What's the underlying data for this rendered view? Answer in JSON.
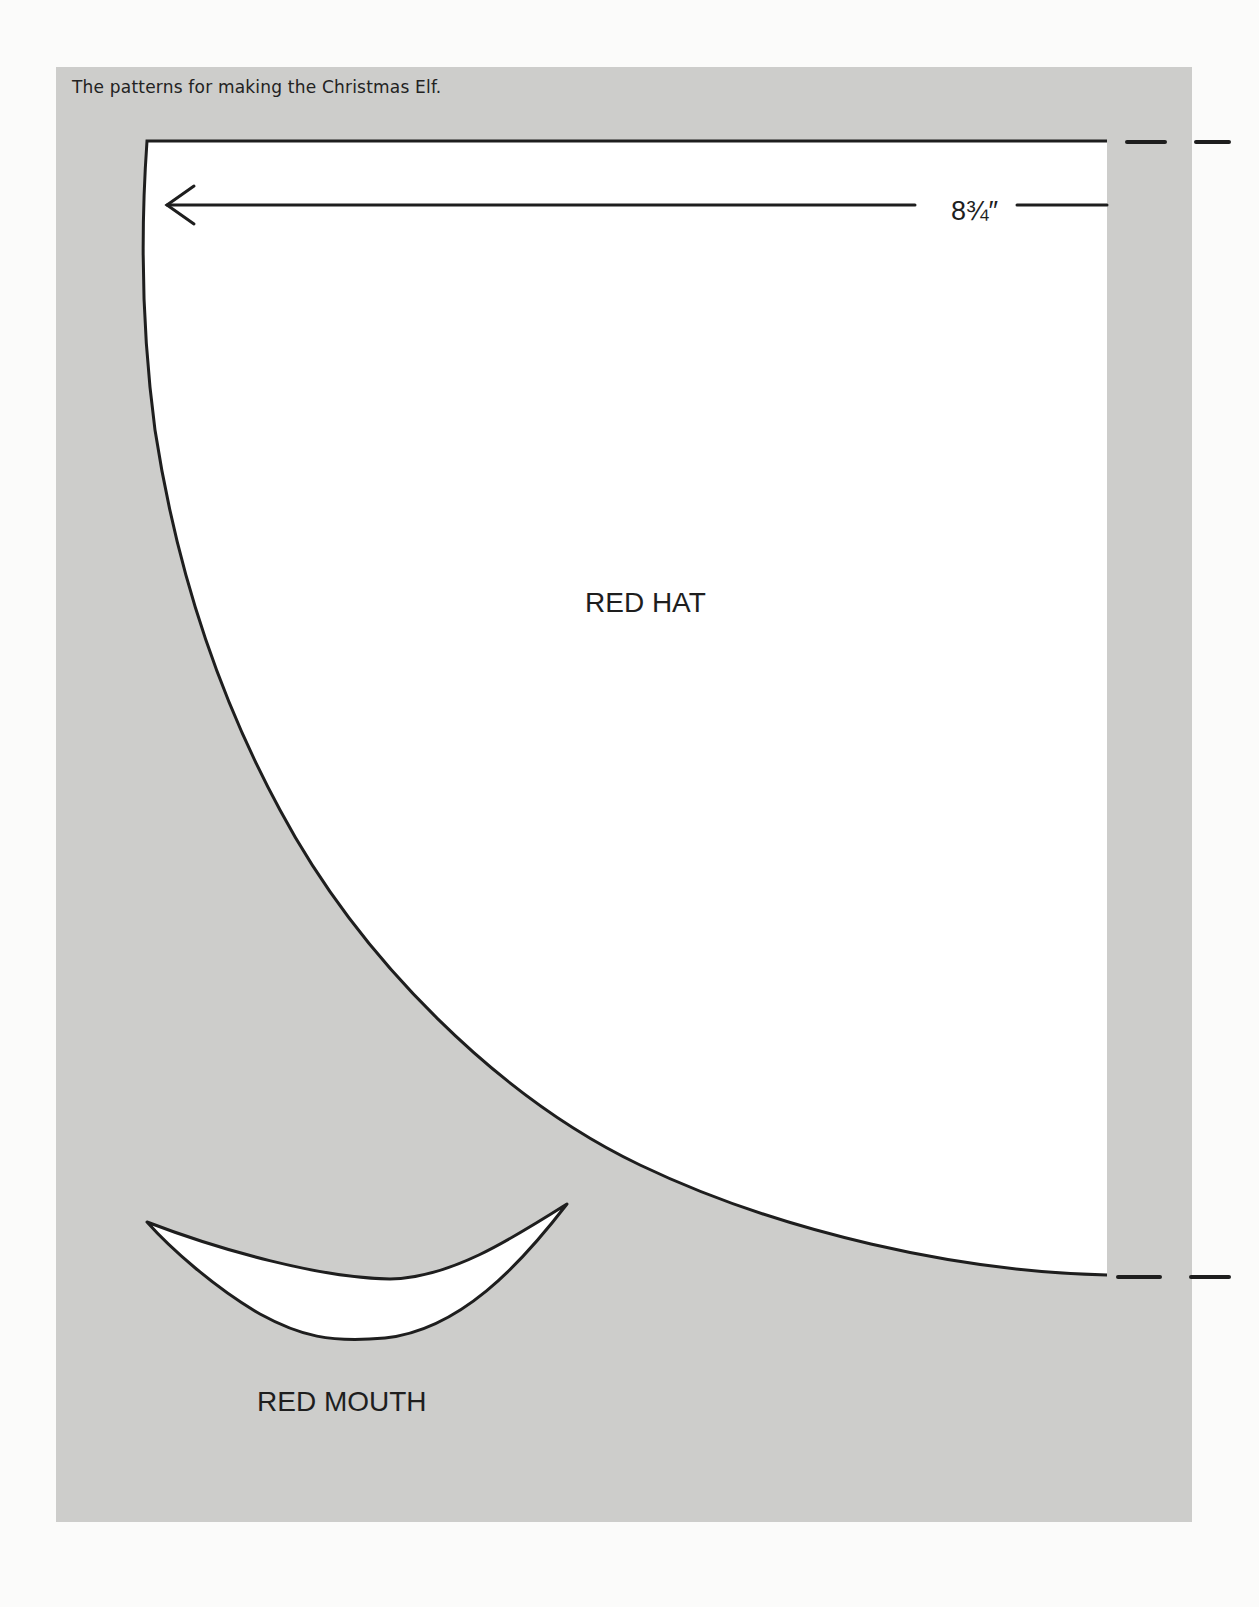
{
  "caption": "The patterns for making the Christmas Elf.",
  "patterns": [
    {
      "name": "hat",
      "label": "RED HAT",
      "dimension": "8¾″"
    },
    {
      "name": "mouth",
      "label": "RED MOUTH"
    }
  ],
  "colors": {
    "page_background": "#fbfbfa",
    "panel_background": "#cdcdcb",
    "pattern_fill": "#ffffff",
    "outline": "#1e1e1e"
  }
}
